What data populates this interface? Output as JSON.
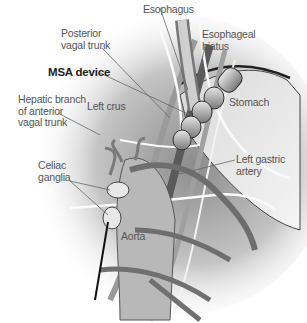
{
  "figure": {
    "labels": {
      "esophagus": "Esophagus",
      "posterior_vagal_trunk": "Posterior\nvagal trunk",
      "esophageal_hiatus": "Esophageal\nhiatus",
      "msa_device": "MSA device",
      "stomach": "Stomach",
      "hepatic_branch": "Hepatic branch\nof anterior\nvagal trunk",
      "left_crus": "Left crus",
      "left_gastric_artery": "Left gastric\nartery",
      "celiac_ganglia": "Celiac\nganglia",
      "aorta": "Aorta"
    },
    "colors": {
      "background": "#ffffff",
      "shadow": "#8a8a8a",
      "tissue": "#bdbdbd",
      "vessel": "#6e6e6e",
      "nerve": "#f5f5f5",
      "label_text": "#555555",
      "leader_line": "#666666"
    }
  }
}
